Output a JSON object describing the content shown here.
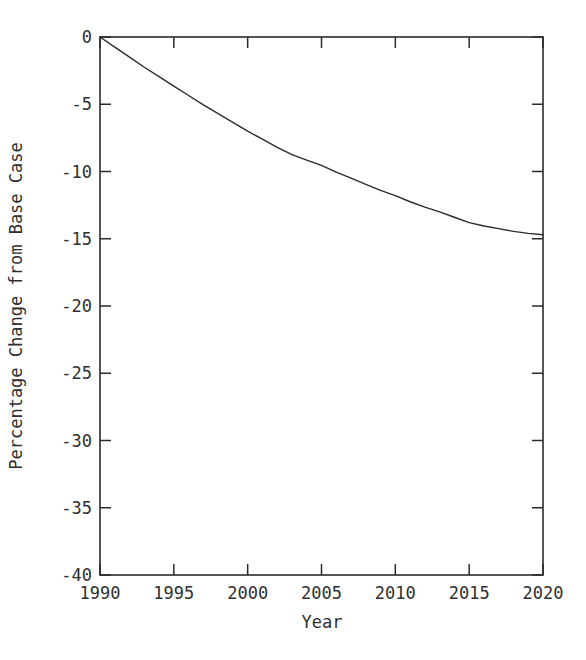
{
  "chart_data": {
    "type": "line",
    "title": "",
    "xlabel": "Year",
    "ylabel": "Percentage Change from Base Case",
    "xlim": [
      1990,
      2020
    ],
    "ylim": [
      -40,
      0
    ],
    "grid": false,
    "legend": null,
    "xticks": [
      1990,
      1995,
      2000,
      2005,
      2010,
      2015,
      2020
    ],
    "xtick_labels": [
      "1990",
      "1995",
      "2000",
      "2005",
      "2010",
      "2015",
      "2020"
    ],
    "yticks": [
      0,
      -5,
      -10,
      -15,
      -20,
      -25,
      -30,
      -35,
      -40
    ],
    "ytick_labels": [
      "0",
      "-5",
      "-10",
      "-15",
      "-20",
      "-25",
      "-30",
      "-35",
      "-40"
    ],
    "line_color": "#2b2b2b",
    "line_width": 1.4,
    "series": [
      {
        "name": "Percentage change from base case",
        "x": [
          1990,
          1991,
          1992,
          1993,
          1994,
          1995,
          1996,
          1997,
          1998,
          1999,
          2000,
          2001,
          2002,
          2003,
          2004,
          2005,
          2006,
          2007,
          2008,
          2009,
          2010,
          2011,
          2012,
          2013,
          2014,
          2015,
          2016,
          2017,
          2018,
          2019,
          2020
        ],
        "values": [
          0.0,
          -0.75,
          -1.5,
          -2.25,
          -2.95,
          -3.65,
          -4.35,
          -5.05,
          -5.7,
          -6.35,
          -7.0,
          -7.6,
          -8.2,
          -8.75,
          -9.15,
          -9.55,
          -10.05,
          -10.5,
          -10.95,
          -11.4,
          -11.8,
          -12.25,
          -12.65,
          -13.0,
          -13.4,
          -13.8,
          -14.05,
          -14.25,
          -14.45,
          -14.6,
          -14.7
        ]
      }
    ]
  },
  "axes": {
    "frame_color": "#2b2b2b",
    "background": "#ffffff"
  }
}
